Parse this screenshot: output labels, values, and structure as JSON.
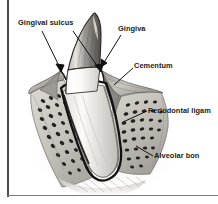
{
  "figure": {
    "kind": "anatomical-illustration",
    "width": 218,
    "height": 204,
    "background_color": "#ffffff",
    "rendering": "grayscale pen-and-ink / airbrush shading"
  },
  "labels": {
    "gingival_sulcus": "Gingival sulcus",
    "gingiva": "Gingiva",
    "cementum": "Cementum",
    "periodontal_ligament": "Periodontal ligam",
    "alveolar_bone": "Alveolar bon"
  },
  "label_notes": {
    "periodontal_ligament_clipped": "Periodontal ligament text is cut off at the right image edge",
    "alveolar_bone_clipped": "Alveolar bone text is cut off at the right image edge"
  },
  "colors": {
    "text": "#1a1a1a",
    "leader_line": "#111111",
    "frame_bar": "#4a4a4f",
    "enamel_light": "#f4f2ee",
    "enamel_shade": "#8d8a86",
    "dentin_root": "#efece6",
    "gingiva_tissue": "#a9a6a2",
    "bone_matrix": "#cfccc6",
    "trabecula_dark": "#2a2a2a",
    "pdl_outline": "#121212"
  },
  "structures": [
    {
      "name": "crown",
      "description": "pointed canine crown, gray-shaded enamel"
    },
    {
      "name": "gingiva",
      "description": "soft tissue collar wrapping the cervical tooth"
    },
    {
      "name": "gingival-sulcus",
      "description": "groove between gingiva and tooth, both sides"
    },
    {
      "name": "cementum",
      "description": "thin layer covering the root surface"
    },
    {
      "name": "periodontal-ligament",
      "description": "dark band between root and alveolar bone"
    },
    {
      "name": "alveolar-bone",
      "description": "speckled trabecular bone socket"
    },
    {
      "name": "root-apex",
      "description": "rounded apical end of the root"
    }
  ],
  "leaders": {
    "gingival_sulcus_left": {
      "from": [
        42,
        31
      ],
      "to": [
        61,
        72
      ]
    },
    "gingival_sulcus_right": {
      "from": [
        73,
        31
      ],
      "to": [
        101,
        72
      ]
    },
    "gingiva": {
      "from": [
        121,
        35
      ],
      "to": [
        101,
        66
      ]
    },
    "cementum": {
      "from": [
        133,
        68
      ],
      "to": [
        113,
        86
      ]
    },
    "periodontal_ligament": {
      "from": [
        147,
        111
      ],
      "to": [
        122,
        122
      ]
    },
    "alveolar_bone": {
      "from": [
        153,
        156
      ],
      "to": [
        136,
        146
      ]
    }
  }
}
